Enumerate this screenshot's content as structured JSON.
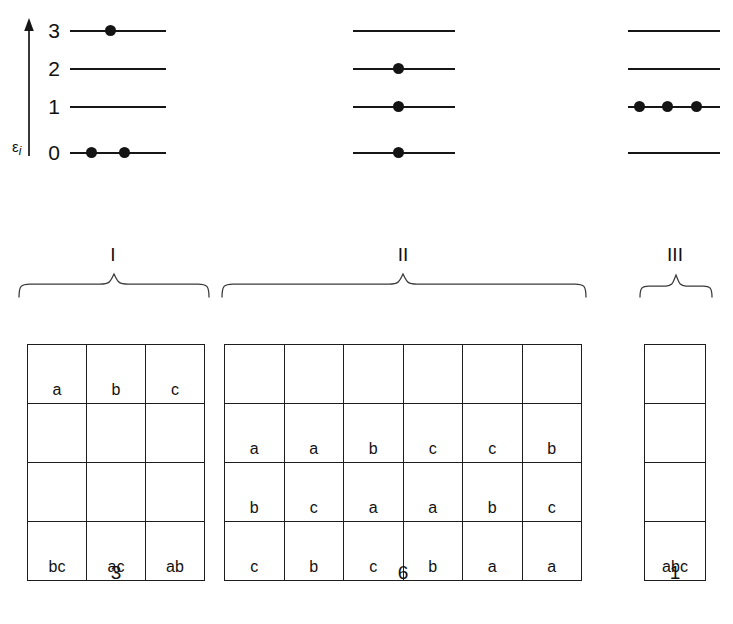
{
  "axis": {
    "label_symbol": "ε",
    "label_subscript": "i",
    "level_labels": [
      "3",
      "2",
      "1",
      "0"
    ]
  },
  "chart_data": {
    "type": "diagram",
    "title": "",
    "level_labels": [
      "3",
      "2",
      "1",
      "0"
    ],
    "configurations": [
      {
        "name": "I",
        "occupancy": {
          "3": 1,
          "2": 0,
          "1": 0,
          "0": 2
        },
        "microstates": 3
      },
      {
        "name": "II",
        "occupancy": {
          "3": 0,
          "2": 1,
          "1": 1,
          "0": 1
        },
        "microstates": 6
      },
      {
        "name": "III",
        "occupancy": {
          "3": 0,
          "2": 0,
          "1": 3,
          "0": 0
        },
        "microstates": 1
      }
    ]
  },
  "diagrams": [
    {
      "name": "diagram-I",
      "levels": [
        {
          "label": "3",
          "dots": 1
        },
        {
          "label": "2",
          "dots": 0
        },
        {
          "label": "1",
          "dots": 0
        },
        {
          "label": "0",
          "dots": 2
        }
      ]
    },
    {
      "name": "diagram-II",
      "levels": [
        {
          "label": "3",
          "dots": 0
        },
        {
          "label": "2",
          "dots": 1
        },
        {
          "label": "1",
          "dots": 1
        },
        {
          "label": "0",
          "dots": 1
        }
      ]
    },
    {
      "name": "diagram-III",
      "levels": [
        {
          "label": "3",
          "dots": 0
        },
        {
          "label": "2",
          "dots": 0
        },
        {
          "label": "1",
          "dots": 3
        },
        {
          "label": "0",
          "dots": 0
        }
      ]
    }
  ],
  "braces": [
    {
      "label": "I"
    },
    {
      "label": "II"
    },
    {
      "label": "III"
    }
  ],
  "tables": {
    "I": {
      "label": "I",
      "columns": 3,
      "rows": [
        [
          "a",
          "b",
          "c"
        ],
        [
          "",
          "",
          ""
        ],
        [
          "",
          "",
          ""
        ],
        [
          "bc",
          "ac",
          "ab"
        ]
      ],
      "count": "3"
    },
    "II": {
      "label": "II",
      "columns": 6,
      "rows": [
        [
          "",
          "",
          "",
          "",
          "",
          ""
        ],
        [
          "a",
          "a",
          "b",
          "c",
          "c",
          "b"
        ],
        [
          "b",
          "c",
          "a",
          "a",
          "b",
          "c"
        ],
        [
          "c",
          "b",
          "c",
          "b",
          "a",
          "a"
        ]
      ],
      "count": "6"
    },
    "III": {
      "label": "III",
      "columns": 1,
      "rows": [
        [
          ""
        ],
        [
          ""
        ],
        [
          ""
        ],
        [
          "abc"
        ]
      ],
      "count": "1"
    }
  },
  "colors": {
    "ink": "#141414",
    "rule": "#1d1d1d",
    "background": "#ffffff"
  }
}
